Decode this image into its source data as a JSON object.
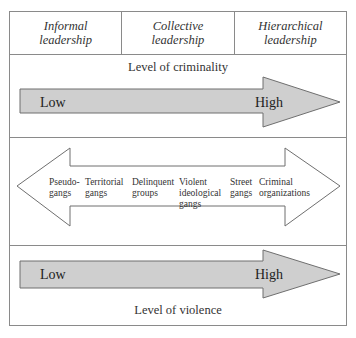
{
  "header": {
    "columns": [
      {
        "line1": "Informal",
        "line2": "leadership"
      },
      {
        "line1": "Collective",
        "line2": "leadership"
      },
      {
        "line1": "Hierarchical",
        "line2": "leadership"
      }
    ]
  },
  "criminality": {
    "label": "Level of criminality",
    "low": "Low",
    "high": "High"
  },
  "gang_types": {
    "items": [
      {
        "lines": [
          "Pseudo-",
          "gangs"
        ]
      },
      {
        "lines": [
          "Territorial",
          "gangs"
        ]
      },
      {
        "lines": [
          "Delinquent",
          "groups"
        ]
      },
      {
        "lines": [
          "Violent",
          "ideological",
          "gangs"
        ]
      },
      {
        "lines": [
          "Street",
          "gangs"
        ]
      },
      {
        "lines": [
          "Criminal",
          "organizations"
        ]
      }
    ]
  },
  "violence": {
    "label": "Level of violence",
    "low": "Low",
    "high": "High"
  },
  "colors": {
    "border": "#8a8a8a",
    "arrow_fill": "#cfcfcf",
    "arrow_stroke": "#6f6f6f"
  }
}
